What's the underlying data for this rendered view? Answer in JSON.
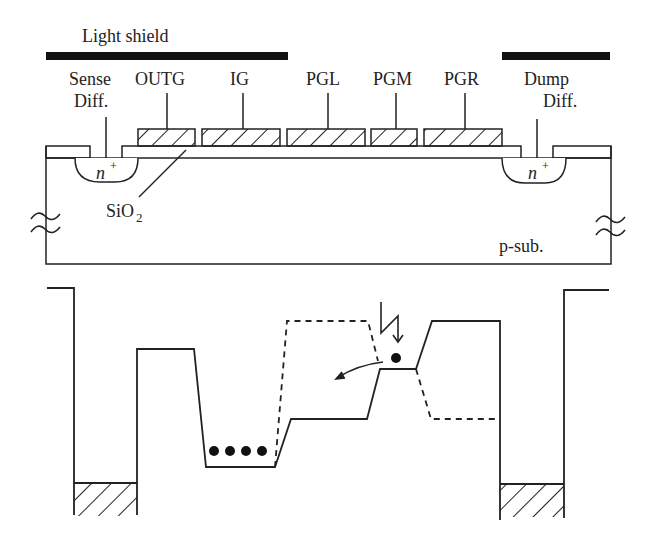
{
  "diagram": {
    "type": "CCD cross-section and potential well diagram",
    "colors": {
      "ink": "#222222",
      "background": "#ffffff"
    },
    "cross_section": {
      "light_shield": {
        "label": "Light shield",
        "bars": [
          {
            "x1": 46,
            "x2": 288
          },
          {
            "x1": 502,
            "x2": 610
          }
        ]
      },
      "gates": [
        {
          "label": "OUTG",
          "x1": 110,
          "x2": 195
        },
        {
          "label": "IG",
          "x1": 202,
          "x2": 280
        },
        {
          "label": "PGL",
          "x1": 287,
          "x2": 365
        },
        {
          "label": "PGM",
          "x1": 371,
          "x2": 417
        },
        {
          "label": "PGR",
          "x1": 424,
          "x2": 502
        }
      ],
      "sense_diffusion": {
        "label_line1": "Sense",
        "label_line2": "Diff.",
        "doping": "n",
        "doping_sup": "+"
      },
      "dump_diffusion": {
        "label_line1": "Dump",
        "label_line2": "Diff.",
        "doping": "n",
        "doping_sup": "+"
      },
      "oxide": {
        "label_main": "SiO",
        "label_sub": "2"
      },
      "substrate": {
        "label": "p-sub."
      }
    },
    "potential_diagram": {
      "signal_charges": {
        "count": 4,
        "shape": "dot"
      },
      "photo_electron": {
        "count": 1,
        "shape": "dot"
      },
      "incident_light": "lightning-arrow",
      "transfer_arrow": "curved-arrow-left",
      "solid_line": "potential state A",
      "dashed_line": "potential state B",
      "hatched_wells": [
        "sense-diffusion-well",
        "dump-diffusion-well"
      ]
    }
  }
}
